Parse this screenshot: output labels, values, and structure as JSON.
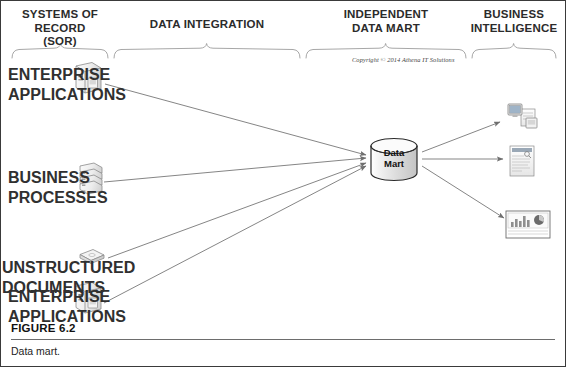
{
  "figure": {
    "number": "FIGURE 6.2",
    "caption": "Data mart.",
    "copyright": "Copyright © 2014 Athena IT Solutions"
  },
  "sections": [
    {
      "id": "sor",
      "line1": "Systems of Record",
      "line2": "(SOR)"
    },
    {
      "id": "data-integration",
      "line1": "Data Integration",
      "line2": ""
    },
    {
      "id": "independent-data-mart",
      "line1": "Independent",
      "line2": "Data Mart"
    },
    {
      "id": "business-intelligence",
      "line1": "Business",
      "line2": "Intelligence"
    }
  ],
  "sources": [
    {
      "id": "enterprise-applications-1",
      "line1": "Enterprise",
      "line2": "Applications",
      "icon": "server-tower-icon"
    },
    {
      "id": "business-processes",
      "line1": "Business",
      "line2": "Processes",
      "icon": "stacked-servers-icon"
    },
    {
      "id": "unstructured-documents",
      "line1": "Unstructured",
      "line2": "Documents",
      "icon": "disk-platter-icon"
    },
    {
      "id": "enterprise-applications-2",
      "line1": "Enterprise",
      "line2": "Applications",
      "icon": "server-tower-icon"
    }
  ],
  "data_mart": {
    "line1": "Data",
    "line2": "Mart",
    "shape": "cylinder-database-icon"
  },
  "outputs": [
    {
      "id": "bi-monitor-report",
      "icon": "monitor-and-document-icon"
    },
    {
      "id": "bi-document-report",
      "icon": "text-report-icon"
    },
    {
      "id": "bi-dashboard-chart",
      "icon": "dashboard-chart-icon"
    }
  ],
  "colors": {
    "line": "#6f6f6f",
    "brace": "#9a9a9a",
    "text": "#2b2b2b",
    "icon_fill": "#e9e9e9",
    "icon_stroke": "#8a8a8a",
    "rule": "#6d6d6d"
  }
}
